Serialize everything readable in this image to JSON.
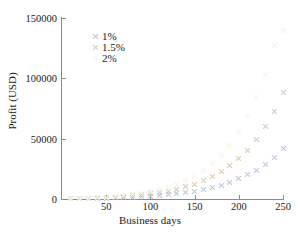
{
  "chart_data": {
    "type": "scatter",
    "title": "",
    "xlabel": "Business days",
    "ylabel": "Profit (USD)",
    "xlim": [
      0,
      250
    ],
    "ylim": [
      0,
      150000
    ],
    "xticks": [
      50,
      100,
      150,
      200,
      250
    ],
    "yticks": [
      0,
      50000,
      100000,
      150000
    ],
    "ytick_labels": [
      "0",
      "50000",
      "100000",
      "150000"
    ],
    "xtick_labels": [
      "50",
      "100",
      "150",
      "200",
      "250"
    ],
    "grid": false,
    "marker": "x",
    "legend_position": "upper-left-inside",
    "x": [
      10,
      20,
      30,
      40,
      50,
      60,
      70,
      80,
      90,
      100,
      110,
      120,
      130,
      140,
      150,
      160,
      170,
      180,
      190,
      200,
      210,
      220,
      230,
      240,
      250
    ],
    "series": [
      {
        "name": "1%",
        "color": "#b9c6dd",
        "values": [
          100,
          220,
          360,
          530,
          730,
          970,
          1250,
          1590,
          1990,
          2460,
          3020,
          3690,
          4490,
          5440,
          6580,
          7940,
          9570,
          11520,
          13850,
          16640,
          19980,
          23990,
          28800,
          34570,
          41500
        ]
      },
      {
        "name": "1.5%",
        "color": "#dcc9a8",
        "values": [
          160,
          340,
          560,
          830,
          1160,
          1560,
          2050,
          2640,
          3360,
          4230,
          5290,
          6580,
          8140,
          10030,
          12320,
          15090,
          18450,
          22510,
          27430,
          33380,
          40580,
          49300,
          59850,
          72620,
          88080
        ]
      },
      {
        "name": "2%",
        "color": "#f6f3e2",
        "values": [
          220,
          480,
          790,
          1180,
          1650,
          2230,
          2950,
          3820,
          4900,
          6230,
          7860,
          9870,
          12340,
          15370,
          19100,
          23680,
          29310,
          36230,
          44730,
          55170,
          67990,
          83740,
          103080,
          126840,
          140000
        ]
      }
    ]
  },
  "legend": {
    "items": [
      {
        "label": "1%"
      },
      {
        "label": "1.5%"
      },
      {
        "label": "2%"
      }
    ]
  },
  "axes": {
    "x_label": "Business days",
    "y_label": "Profit (USD)"
  }
}
